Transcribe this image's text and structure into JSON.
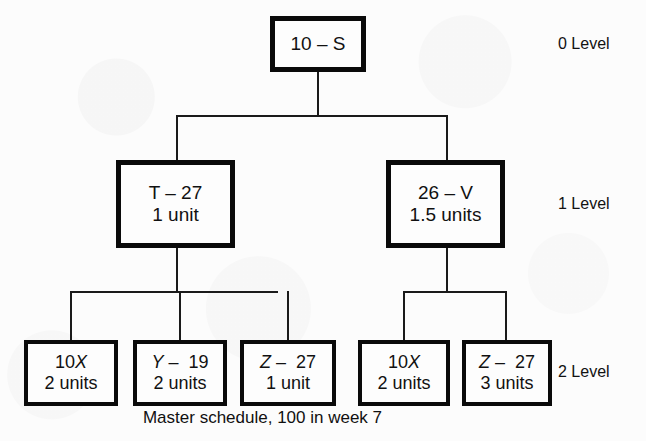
{
  "diagram": {
    "caption": "Master schedule, 100 in week 7",
    "levels": [
      {
        "id": "level-0",
        "label": "0 Level"
      },
      {
        "id": "level-1",
        "label": "1 Level"
      },
      {
        "id": "level-2",
        "label": "2 Level"
      }
    ],
    "colors": {
      "box_border": "#0a0a0a",
      "box_fill": "#fdfdfd",
      "connector": "#1a1a1a",
      "background": "#fcfcfc",
      "text": "#111111"
    },
    "nodes": {
      "root": {
        "name": "10 – S",
        "quantity": ""
      },
      "level1": [
        {
          "name": "T – 27",
          "quantity": "1 unit"
        },
        {
          "name": "26 – V",
          "quantity": "1.5 units"
        }
      ],
      "level2": [
        {
          "name_prefix": "10",
          "name_italic": "X",
          "quantity": "2 units"
        },
        {
          "name_italic": "Y",
          "name_suffix": " –  19",
          "quantity": "2 units"
        },
        {
          "name_italic": "Z",
          "name_suffix": " –  27",
          "quantity": "1 unit"
        },
        {
          "name_prefix": "10",
          "name_italic": "X",
          "quantity": "2 units"
        },
        {
          "name_italic": "Z",
          "name_suffix": " –  27",
          "quantity": "3 units"
        }
      ]
    }
  }
}
